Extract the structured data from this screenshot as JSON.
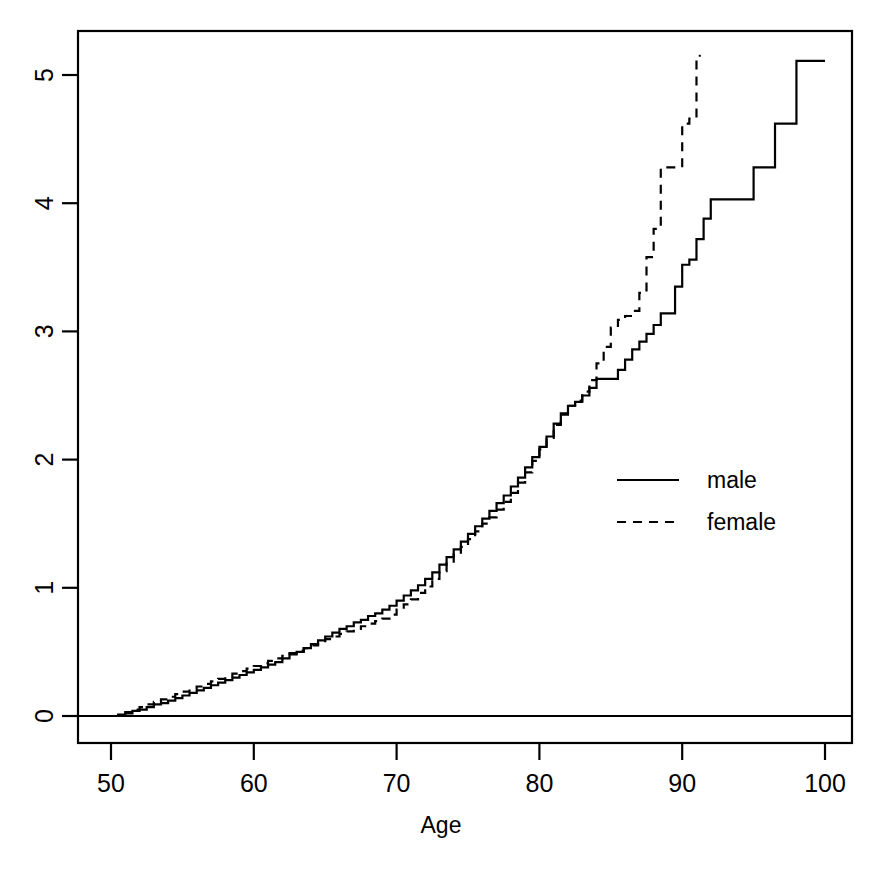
{
  "chart_data": {
    "type": "line",
    "title": "",
    "subtitle": "",
    "xlabel": "Age",
    "ylabel": "",
    "xlim": [
      48,
      101.5
    ],
    "ylim": [
      -0.32,
      5.36
    ],
    "xticks": [
      50,
      60,
      70,
      80,
      90,
      100
    ],
    "yticks": [
      0,
      1,
      2,
      3,
      4,
      5
    ],
    "xtick_labels": [
      "50",
      "60",
      "70",
      "80",
      "90",
      "100"
    ],
    "ytick_labels": [
      "0",
      "1",
      "2",
      "3",
      "4",
      "5"
    ],
    "grid": false,
    "y_axis_label_rotation": "vertical",
    "reference_lines": [
      {
        "name": "zero-line",
        "axis": "y",
        "value": 0
      }
    ],
    "legend": {
      "position": "center-right",
      "entries": [
        {
          "label": "male",
          "style": "solid"
        },
        {
          "label": "female",
          "style": "dashed"
        }
      ]
    },
    "series": [
      {
        "name": "male",
        "style": "solid",
        "color": "#000000",
        "x": [
          50.0,
          50.5,
          51.0,
          51.5,
          52.0,
          52.5,
          53.0,
          53.5,
          54.0,
          54.5,
          55.0,
          55.5,
          56.0,
          56.5,
          57.0,
          57.5,
          58.0,
          58.5,
          59.0,
          59.5,
          60.0,
          60.5,
          61.0,
          61.5,
          62.0,
          62.5,
          63.0,
          63.5,
          64.0,
          64.5,
          65.0,
          65.5,
          66.0,
          66.5,
          67.0,
          67.5,
          68.0,
          68.5,
          69.0,
          69.5,
          70.0,
          70.5,
          71.0,
          71.5,
          72.0,
          72.5,
          73.0,
          73.5,
          74.0,
          74.5,
          75.0,
          75.5,
          76.0,
          76.5,
          77.0,
          77.5,
          78.0,
          78.5,
          79.0,
          79.5,
          80.0,
          80.5,
          81.0,
          81.5,
          82.0,
          82.5,
          83.0,
          83.5,
          84.0,
          84.5,
          85.0,
          85.5,
          86.0,
          86.5,
          87.0,
          87.5,
          88.0,
          88.5,
          89.0,
          89.5,
          90.0,
          90.5,
          91.0,
          91.5,
          92.0,
          93.0,
          94.0,
          95.0,
          95.6,
          96.5,
          98.0,
          100.0
        ],
        "y": [
          0.0,
          0.01,
          0.02,
          0.04,
          0.05,
          0.07,
          0.09,
          0.1,
          0.12,
          0.14,
          0.16,
          0.18,
          0.2,
          0.22,
          0.24,
          0.26,
          0.28,
          0.3,
          0.32,
          0.34,
          0.36,
          0.38,
          0.4,
          0.42,
          0.45,
          0.48,
          0.5,
          0.53,
          0.56,
          0.59,
          0.62,
          0.65,
          0.68,
          0.7,
          0.73,
          0.75,
          0.78,
          0.8,
          0.83,
          0.86,
          0.9,
          0.94,
          0.98,
          1.02,
          1.07,
          1.12,
          1.18,
          1.24,
          1.3,
          1.36,
          1.42,
          1.48,
          1.54,
          1.6,
          1.66,
          1.72,
          1.79,
          1.86,
          1.94,
          2.02,
          2.1,
          2.18,
          2.28,
          2.36,
          2.42,
          2.45,
          2.5,
          2.56,
          2.63,
          2.63,
          2.63,
          2.7,
          2.78,
          2.86,
          2.92,
          2.98,
          3.05,
          3.14,
          3.14,
          3.35,
          3.52,
          3.56,
          3.72,
          3.88,
          4.03,
          4.03,
          4.03,
          4.28,
          4.28,
          4.62,
          5.11,
          5.11
        ]
      },
      {
        "name": "female",
        "style": "dashed",
        "color": "#000000",
        "x": [
          50.0,
          50.5,
          51.0,
          51.5,
          52.0,
          52.5,
          53.0,
          53.5,
          54.0,
          54.5,
          55.0,
          55.5,
          56.0,
          56.5,
          57.0,
          57.5,
          58.0,
          58.5,
          59.0,
          59.5,
          60.0,
          60.5,
          61.0,
          61.5,
          62.0,
          62.5,
          63.0,
          63.5,
          64.0,
          64.5,
          65.0,
          65.5,
          66.0,
          66.5,
          67.0,
          67.5,
          68.0,
          68.5,
          69.0,
          69.5,
          70.0,
          70.5,
          71.0,
          71.5,
          72.0,
          72.5,
          73.0,
          73.5,
          74.0,
          74.5,
          75.0,
          75.5,
          76.0,
          76.5,
          77.0,
          77.5,
          78.0,
          78.5,
          79.0,
          79.5,
          80.0,
          80.5,
          81.0,
          81.5,
          82.0,
          82.5,
          83.0,
          83.5,
          84.0,
          84.5,
          85.0,
          85.5,
          86.0,
          86.5,
          87.0,
          87.5,
          88.0,
          88.5,
          89.0,
          89.5,
          90.0,
          90.5,
          91.0,
          91.3
        ],
        "y": [
          0.0,
          0.02,
          0.03,
          0.05,
          0.07,
          0.09,
          0.11,
          0.13,
          0.15,
          0.17,
          0.19,
          0.21,
          0.23,
          0.25,
          0.27,
          0.29,
          0.31,
          0.33,
          0.35,
          0.37,
          0.39,
          0.41,
          0.43,
          0.45,
          0.47,
          0.49,
          0.51,
          0.53,
          0.55,
          0.57,
          0.6,
          0.62,
          0.64,
          0.66,
          0.68,
          0.7,
          0.72,
          0.74,
          0.76,
          0.79,
          0.83,
          0.87,
          0.91,
          0.96,
          1.01,
          1.07,
          1.13,
          1.19,
          1.26,
          1.32,
          1.38,
          1.44,
          1.5,
          1.55,
          1.61,
          1.67,
          1.74,
          1.82,
          1.9,
          1.99,
          2.08,
          2.17,
          2.27,
          2.35,
          2.42,
          2.46,
          2.53,
          2.62,
          2.75,
          2.88,
          3.03,
          3.09,
          3.12,
          3.16,
          3.3,
          3.58,
          3.8,
          4.28,
          4.28,
          4.28,
          4.62,
          4.66,
          5.15,
          5.15
        ]
      }
    ]
  },
  "axes": {
    "x_title": "Age",
    "y_title": ""
  },
  "legend_items": [
    {
      "label": "male",
      "style": "solid"
    },
    {
      "label": "female",
      "style": "dashed"
    }
  ],
  "colors": {
    "foreground": "#000000",
    "background": "#ffffff"
  }
}
